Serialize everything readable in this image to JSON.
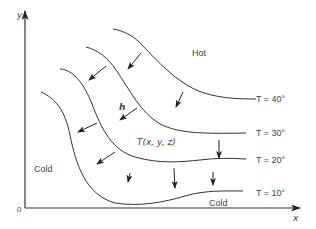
{
  "diagram": {
    "axes": {
      "x_label": "x",
      "y_label": "y",
      "origin_label": "0"
    },
    "regions": {
      "hot": "Hot",
      "cold_left": "Cold",
      "cold_bottom": "Cold"
    },
    "field_label": "T(x, y, z)",
    "vector_label": "h",
    "isotherms": [
      {
        "label": "T = 40°",
        "value": 40
      },
      {
        "label": "T = 30°",
        "value": 30
      },
      {
        "label": "T = 20°",
        "value": 20
      },
      {
        "label": "T = 10°",
        "value": 10
      }
    ],
    "colors": {
      "line": "#333333",
      "text": "#444444",
      "background": "#ffffff"
    }
  }
}
